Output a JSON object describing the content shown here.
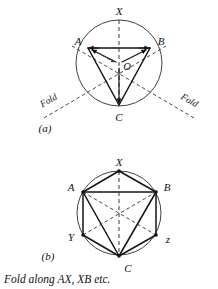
{
  "figure": {
    "colors": {
      "ink": "#141414",
      "circle_stroke": "#2b2b2b",
      "dash_stroke": "#3a3a3a",
      "background": "#ffffff"
    },
    "caption": "Fold along AX, XB etc.",
    "part_a": {
      "label": "(a)",
      "center_label": "O",
      "fold_label_left": "Fold",
      "fold_label_right": "Fold",
      "vertices": [
        {
          "name": "X",
          "label": "X",
          "x": 119,
          "y": 20,
          "label_x": 119,
          "label_y": 15
        },
        {
          "name": "A",
          "label": "A",
          "x": 88,
          "y": 48,
          "label_x": 78,
          "label_y": 45
        },
        {
          "name": "B",
          "label": "B",
          "x": 150,
          "y": 48,
          "label_x": 161,
          "label_y": 45
        },
        {
          "name": "C",
          "label": "C",
          "x": 119,
          "y": 106,
          "label_x": 119,
          "label_y": 119
        },
        {
          "name": "O",
          "label": "O",
          "x": 119,
          "y": 63,
          "label_x": 127,
          "label_y": 70
        }
      ],
      "circle": {
        "cx": 119,
        "cy": 63,
        "r": 43
      },
      "solid_edges": [
        {
          "from": "A",
          "to": "B"
        },
        {
          "from": "A",
          "to": "C"
        },
        {
          "from": "B",
          "to": "C"
        }
      ],
      "dashed_lines": [
        {
          "name": "axis-X-C",
          "from": "X",
          "to": "C"
        },
        {
          "name": "fold-through-A",
          "note": "A through O extended past circle"
        },
        {
          "name": "fold-through-B",
          "note": "B through O extended past circle"
        }
      ]
    },
    "part_b": {
      "label": "(b)",
      "vertices": [
        {
          "name": "X",
          "label": "X",
          "x": 119,
          "y": 171,
          "label_x": 119,
          "label_y": 165
        },
        {
          "name": "B",
          "label": "B",
          "x": 156,
          "y": 192,
          "label_x": 167,
          "label_y": 190
        },
        {
          "name": "z",
          "label": "z",
          "x": 156,
          "y": 235,
          "label_x": 168,
          "label_y": 241
        },
        {
          "name": "C",
          "label": "C",
          "x": 119,
          "y": 256,
          "label_x": 126,
          "label_y": 270
        },
        {
          "name": "Y",
          "label": "Y",
          "x": 83,
          "y": 235,
          "label_x": 72,
          "label_y": 240
        },
        {
          "name": "A",
          "label": "A",
          "x": 83,
          "y": 192,
          "label_x": 72,
          "label_y": 190
        }
      ],
      "circle": {
        "cx": 119,
        "cy": 213,
        "r": 42
      },
      "solid_edges": [
        {
          "from": "X",
          "to": "B"
        },
        {
          "from": "B",
          "to": "z"
        },
        {
          "from": "z",
          "to": "C"
        },
        {
          "from": "C",
          "to": "Y"
        },
        {
          "from": "Y",
          "to": "A"
        },
        {
          "from": "A",
          "to": "X"
        },
        {
          "from": "A",
          "to": "B"
        },
        {
          "from": "A",
          "to": "C"
        },
        {
          "from": "C",
          "to": "B"
        },
        {
          "from": "X",
          "to": "C"
        }
      ],
      "dashed_edges": [
        {
          "from": "A",
          "to": "z"
        },
        {
          "from": "Y",
          "to": "B"
        },
        {
          "from": "X",
          "to": "C"
        }
      ]
    }
  }
}
